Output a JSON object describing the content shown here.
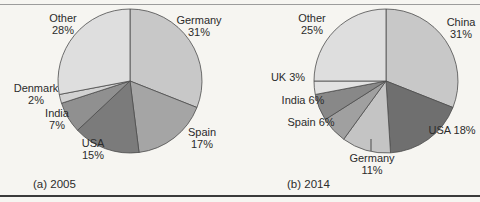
{
  "page": {
    "background": "#f6f5f1",
    "top_rule_color": "#9c9c9c",
    "bottom_rule_color": "#3a3a3a",
    "slice_stroke_color": "#4d4d4d",
    "text_color": "#2b2b2b"
  },
  "chart_data": [
    {
      "type": "pie",
      "id": "2005",
      "title": "(a) 2005",
      "caption_x": 33,
      "caption_y": 178,
      "center_x": 130,
      "center_y": 81,
      "radius": 72,
      "start_angle_deg": 0,
      "direction": "clockwise",
      "legend_position": "labels-around-pie",
      "categories": [
        "Germany",
        "Spain",
        "USA",
        "India",
        "Denmark",
        "Other"
      ],
      "values": [
        31,
        17,
        15,
        7,
        2,
        28
      ],
      "unit": "%",
      "slices": [
        {
          "name": "Germany",
          "value": 31,
          "color": "#c8c8c8",
          "label_lines": [
            "Germany",
            "31%"
          ],
          "label_x": 199,
          "label_y": 14
        },
        {
          "name": "Spain",
          "value": 17,
          "color": "#a5a5a5",
          "label_lines": [
            "Spain",
            "17%"
          ],
          "label_x": 202,
          "label_y": 126
        },
        {
          "name": "USA",
          "value": 15,
          "color": "#7b7b7b",
          "label_lines": [
            "USA",
            "15%"
          ],
          "label_x": 93,
          "label_y": 137
        },
        {
          "name": "India",
          "value": 7,
          "color": "#909090",
          "label_lines": [
            "India",
            "7%"
          ],
          "label_x": 57,
          "label_y": 107
        },
        {
          "name": "Denmark",
          "value": 2,
          "color": "#d2d2d2",
          "label_lines": [
            "Denmark",
            "2%"
          ],
          "label_x": 36,
          "label_y": 82
        },
        {
          "name": "Other",
          "value": 28,
          "color": "#dedede",
          "label_lines": [
            "Other",
            "28%"
          ],
          "label_x": 63,
          "label_y": 12
        }
      ]
    },
    {
      "type": "pie",
      "id": "2014",
      "title": "(b) 2014",
      "caption_x": 287,
      "caption_y": 178,
      "center_x": 386,
      "center_y": 81,
      "radius": 72,
      "start_angle_deg": 0,
      "direction": "clockwise",
      "legend_position": "labels-around-pie",
      "categories": [
        "China",
        "USA",
        "Germany",
        "Spain",
        "India",
        "UK",
        "Other"
      ],
      "values": [
        31,
        18,
        11,
        6,
        6,
        3,
        25
      ],
      "unit": "%",
      "slices": [
        {
          "name": "China",
          "value": 31,
          "color": "#c8c8c8",
          "label_lines": [
            "China",
            "31%"
          ],
          "label_x": 461,
          "label_y": 16
        },
        {
          "name": "USA",
          "value": 18,
          "color": "#6f6f6f",
          "label_lines": [
            "USA 18%"
          ],
          "label_x": 452,
          "label_y": 124
        },
        {
          "name": "Germany",
          "value": 11,
          "color": "#c4c4c4",
          "label_lines": [
            "Germany",
            "11%"
          ],
          "label_x": 372,
          "label_y": 152,
          "leader": {
            "x1": 371,
            "y1": 139,
            "x2": 371,
            "y2": 151
          }
        },
        {
          "name": "Spain",
          "value": 6,
          "color": "#a0a0a0",
          "label_lines": [
            "Spain 6%"
          ],
          "label_x": 311,
          "label_y": 116
        },
        {
          "name": "India",
          "value": 6,
          "color": "#888888",
          "label_lines": [
            "India 6%"
          ],
          "label_x": 303,
          "label_y": 94
        },
        {
          "name": "UK",
          "value": 3,
          "color": "#e2e2e2",
          "label_lines": [
            "UK 3%"
          ],
          "label_x": 288,
          "label_y": 71
        },
        {
          "name": "Other",
          "value": 25,
          "color": "#dedede",
          "label_lines": [
            "Other",
            "25%"
          ],
          "label_x": 312,
          "label_y": 12
        }
      ]
    }
  ]
}
